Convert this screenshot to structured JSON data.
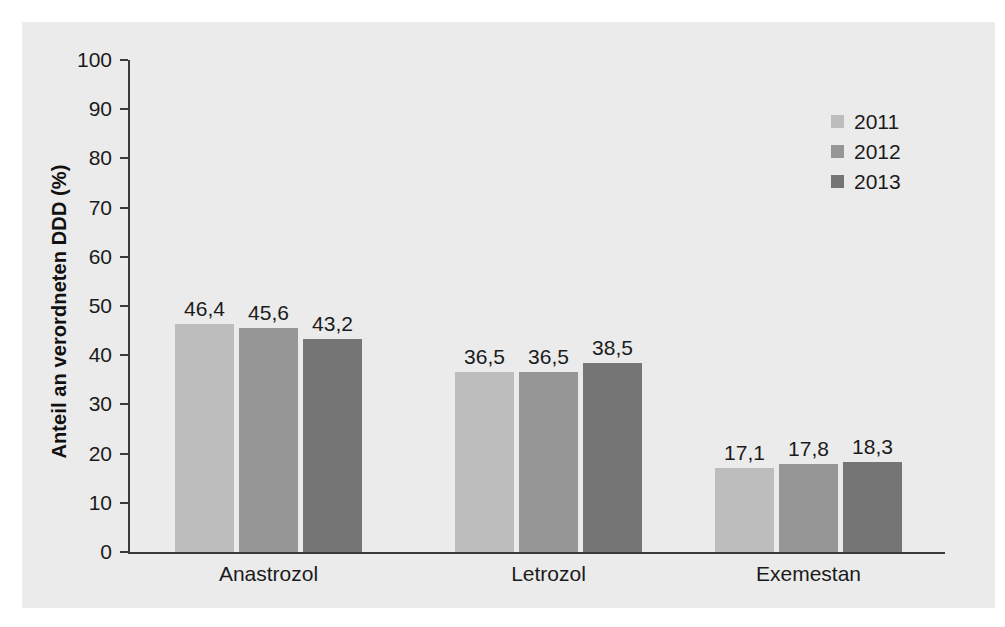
{
  "chart_data": {
    "type": "bar",
    "title": "",
    "subtitle": "",
    "xlabel": "",
    "ylabel": "Anteil an verordneten DDD (%)",
    "ylim": [
      0,
      100
    ],
    "grid": false,
    "legend_position": "top-right",
    "categories": [
      "Anastrozol",
      "Letrozol",
      "Exemestan"
    ],
    "y_ticks": [
      "0",
      "10",
      "20",
      "30",
      "40",
      "50",
      "60",
      "70",
      "80",
      "90",
      "100"
    ],
    "series": [
      {
        "name": "2011",
        "color": "#bdbdbd",
        "values": [
          46.4,
          36.5,
          17.1
        ],
        "labels": [
          "46,4",
          "36,5",
          "17,1"
        ]
      },
      {
        "name": "2012",
        "color": "#969696",
        "values": [
          45.6,
          36.5,
          17.8
        ],
        "labels": [
          "45,6",
          "36,5",
          "17,8"
        ]
      },
      {
        "name": "2013",
        "color": "#757575",
        "values": [
          43.2,
          38.5,
          18.3
        ],
        "labels": [
          "43,2",
          "38,5",
          "18,3"
        ]
      }
    ]
  },
  "legend": {
    "items": [
      {
        "label": "2011",
        "color": "#bdbdbd"
      },
      {
        "label": "2012",
        "color": "#969696"
      },
      {
        "label": "2013",
        "color": "#757575"
      }
    ]
  },
  "axes": {
    "y_title": "Anteil an verordneten DDD (%)",
    "y_ticks": [
      "100",
      "90",
      "80",
      "70",
      "60",
      "50",
      "40",
      "30",
      "20",
      "10",
      "0"
    ],
    "x_categories": [
      "Anastrozol",
      "Letrozol",
      "Exemestan"
    ]
  }
}
